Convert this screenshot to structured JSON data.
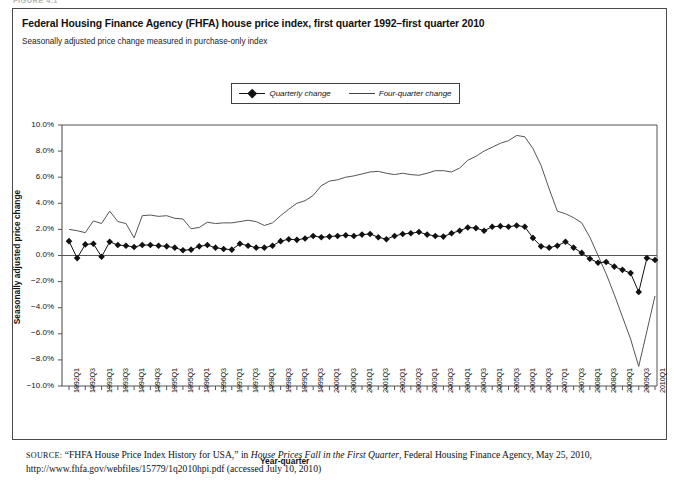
{
  "figure_label": "FIGURE 4.1",
  "title": "Federal Housing Finance Agency (FHFA) house price index, first quarter 1992–first quarter 2010",
  "subtitle": "Seasonally adjusted price change measured in purchase-only index",
  "legend": {
    "quarterly_label": "Quarterly change",
    "four_quarter_label": "Four-quarter change"
  },
  "source": {
    "prefix": "SOURCE:",
    "text_1": " “FHFA House Price Index History for USA,” in ",
    "italic_1": "House Prices Fall in the First Quarter",
    "text_2": ", Federal Housing Finance Agency, May 25, 2010, http://www.fhfa.gov/webfiles/15779/1q2010hpi.pdf (accessed July 10, 2010)"
  },
  "colors": {
    "quarterly": "#111111",
    "four_quarter": "#555555",
    "axis": "#555555",
    "border": "#4a4a4a",
    "background": "#ffffff"
  },
  "chart_data": {
    "type": "line",
    "title": "Federal Housing Finance Agency (FHFA) house price index, first quarter 1992–first quarter 2010",
    "subtitle": "Seasonally adjusted price change measured in purchase-only index",
    "xlabel": "Year-quarter",
    "ylabel": "Seasonally adjusted price change",
    "ylim": [
      -10.0,
      10.0
    ],
    "ytick_step": 2.0,
    "ytick_labels": [
      "10.0%",
      "8.0%",
      "6.0%",
      "4.0%",
      "2.0%",
      "0.0%",
      "−2.0%",
      "−4.0%",
      "−6.0%",
      "−8.0%",
      "−10.0%"
    ],
    "ytick_values": [
      10.0,
      8.0,
      6.0,
      4.0,
      2.0,
      0.0,
      -2.0,
      -4.0,
      -6.0,
      -8.0,
      -10.0
    ],
    "grid": false,
    "legend_position": "top-center",
    "units": "percent",
    "x": [
      "1992Q1",
      "1992Q2",
      "1992Q3",
      "1992Q4",
      "1993Q1",
      "1993Q2",
      "1993Q3",
      "1993Q4",
      "1994Q1",
      "1994Q2",
      "1994Q3",
      "1994Q4",
      "1995Q1",
      "1995Q2",
      "1995Q3",
      "1995Q4",
      "1996Q1",
      "1996Q2",
      "1996Q3",
      "1996Q4",
      "1997Q1",
      "1997Q2",
      "1997Q3",
      "1997Q4",
      "1998Q1",
      "1998Q2",
      "1998Q3",
      "1998Q4",
      "1999Q1",
      "1999Q2",
      "1999Q3",
      "1999Q4",
      "2000Q1",
      "2000Q2",
      "2000Q3",
      "2000Q4",
      "2001Q1",
      "2001Q2",
      "2001Q3",
      "2001Q4",
      "2002Q1",
      "2002Q2",
      "2002Q3",
      "2002Q4",
      "2003Q1",
      "2003Q2",
      "2003Q3",
      "2003Q4",
      "2004Q1",
      "2004Q2",
      "2004Q3",
      "2004Q4",
      "2005Q1",
      "2005Q2",
      "2005Q3",
      "2005Q4",
      "2006Q1",
      "2006Q2",
      "2006Q3",
      "2006Q4",
      "2007Q1",
      "2007Q2",
      "2007Q3",
      "2007Q4",
      "2008Q1",
      "2008Q2",
      "2008Q3",
      "2008Q4",
      "2009Q1",
      "2009Q2",
      "2009Q3",
      "2009Q4",
      "2010Q1"
    ],
    "xtick_labels_shown": [
      "1992Q1",
      "1992Q3",
      "1993Q1",
      "1993Q3",
      "1994Q1",
      "1994Q3",
      "1995Q1",
      "1995Q3",
      "1996Q1",
      "1996Q3",
      "1997Q1",
      "1997Q3",
      "1998Q1",
      "1998Q3",
      "1999Q1",
      "1999Q3",
      "2000Q1",
      "2000Q3",
      "2001Q1",
      "2001Q3",
      "2002Q1",
      "2002Q3",
      "2003Q1",
      "2003Q3",
      "2004Q1",
      "2004Q3",
      "2005Q1",
      "2005Q3",
      "2006Q1",
      "2006Q3",
      "2007Q1",
      "2007Q3",
      "2008Q1",
      "2008Q3",
      "2009Q1",
      "2009Q3",
      "2010Q1"
    ],
    "series": [
      {
        "name": "Quarterly change",
        "marker": "diamond",
        "values": [
          1.1,
          -0.2,
          0.85,
          0.9,
          -0.1,
          1.05,
          0.8,
          0.75,
          0.65,
          0.8,
          0.8,
          0.75,
          0.7,
          0.6,
          0.4,
          0.45,
          0.7,
          0.8,
          0.6,
          0.5,
          0.45,
          0.9,
          0.75,
          0.6,
          0.6,
          0.75,
          1.1,
          1.25,
          1.2,
          1.3,
          1.5,
          1.4,
          1.45,
          1.5,
          1.55,
          1.5,
          1.6,
          1.65,
          1.4,
          1.25,
          1.5,
          1.65,
          1.7,
          1.8,
          1.6,
          1.5,
          1.45,
          1.7,
          1.9,
          2.15,
          2.1,
          1.9,
          2.2,
          2.25,
          2.2,
          2.3,
          2.2,
          1.35,
          0.7,
          0.6,
          0.75,
          1.05,
          0.6,
          0.2,
          -0.25,
          -0.55,
          -0.5,
          -0.85,
          -1.1,
          -1.35,
          -2.8,
          -0.2,
          -0.35
        ]
      },
      {
        "name": "Four-quarter change",
        "marker": "none",
        "values": [
          2.0,
          1.9,
          1.75,
          2.65,
          2.45,
          3.4,
          2.6,
          2.45,
          1.35,
          3.05,
          3.1,
          3.0,
          3.05,
          2.85,
          2.8,
          2.05,
          2.15,
          2.55,
          2.45,
          2.5,
          2.5,
          2.6,
          2.7,
          2.6,
          2.3,
          2.5,
          3.05,
          3.55,
          4.0,
          4.2,
          4.6,
          5.35,
          5.7,
          5.8,
          6.0,
          6.1,
          6.25,
          6.4,
          6.45,
          6.3,
          6.2,
          6.3,
          6.2,
          6.15,
          6.3,
          6.5,
          6.5,
          6.4,
          6.7,
          7.3,
          7.6,
          8.0,
          8.3,
          8.6,
          8.8,
          9.2,
          9.1,
          8.2,
          6.9,
          5.1,
          3.4,
          3.2,
          2.9,
          2.5,
          1.4,
          0.0,
          -1.4,
          -3.0,
          -4.7,
          -6.4,
          -8.5,
          -5.8,
          -3.1
        ]
      }
    ],
    "annotations": {
      "peak_four_quarter": {
        "x": "2005Q4",
        "y": 9.2
      },
      "trough_four_quarter": {
        "x": "2009Q3",
        "y": -8.5
      },
      "trough_quarterly": {
        "x": "2009Q3",
        "y": -2.8
      }
    }
  }
}
